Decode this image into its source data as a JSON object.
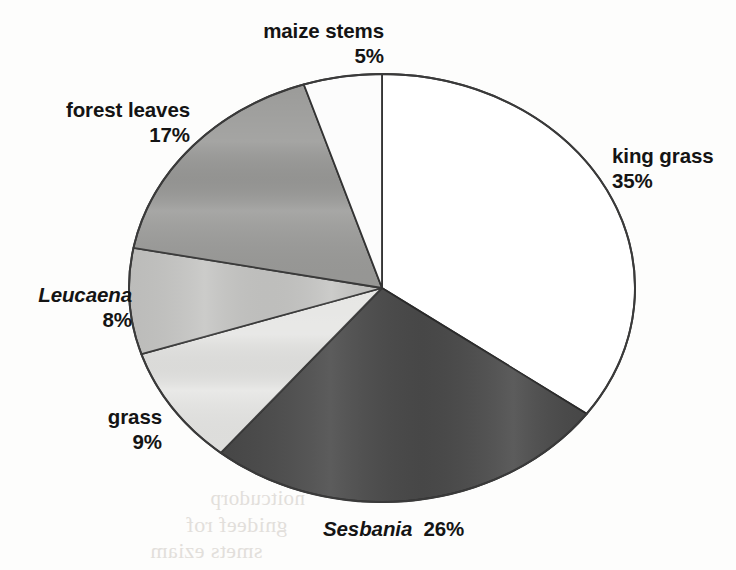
{
  "chart_data": {
    "type": "pie",
    "title": "",
    "subtitle": "",
    "xlabel": "",
    "ylabel": "",
    "legend_position": "none",
    "grid": false,
    "start_angle_deg": 0,
    "direction": "clockwise",
    "units": "percent",
    "total": 100,
    "categories": [
      "king grass",
      "Sesbania",
      "grass",
      "Leucaena",
      "forest leaves",
      "maize stems"
    ],
    "values": [
      35,
      26,
      9,
      8,
      17,
      5
    ],
    "slices": [
      {
        "name": "king grass",
        "value": 35,
        "value_label": "35%",
        "fill": "#ffffff",
        "stroke": "#333333",
        "italic_name": false,
        "label_lines": [
          "king grass",
          "35%"
        ],
        "label_align": "left"
      },
      {
        "name": "Sesbania",
        "value": 26,
        "value_label": "26%",
        "fill": "#4a4a4a",
        "stroke": "#2a2a2a",
        "italic_name": true,
        "label_lines": [
          "Sesbania",
          "26%"
        ],
        "label_align": "inline"
      },
      {
        "name": "grass",
        "value": 9,
        "value_label": "9%",
        "fill": "#e6e6e4",
        "stroke": "#3a3a3a",
        "italic_name": false,
        "label_lines": [
          "grass",
          "9%"
        ],
        "label_align": "right"
      },
      {
        "name": "Leucaena",
        "value": 8,
        "value_label": "8%",
        "fill": "#c6c6c4",
        "stroke": "#3a3a3a",
        "italic_name": true,
        "label_lines": [
          "Leucaena",
          "8%"
        ],
        "label_align": "right"
      },
      {
        "name": "forest leaves",
        "value": 17,
        "value_label": "17%",
        "fill": "#9b9b99",
        "stroke": "#3a3a3a",
        "italic_name": false,
        "label_lines": [
          "forest leaves",
          "17%"
        ],
        "label_align": "right"
      },
      {
        "name": "maize stems",
        "value": 5,
        "value_label": "5%",
        "fill": "#fcfcfc",
        "stroke": "#333333",
        "italic_name": false,
        "label_lines": [
          "maize stems",
          "5%"
        ],
        "label_align": "right"
      }
    ]
  },
  "labels": {
    "king_grass": {
      "name": "king grass",
      "percent": "35%"
    },
    "sesbania": {
      "name": "Sesbania",
      "percent": "26%"
    },
    "grass": {
      "name": "grass",
      "percent": "9%"
    },
    "leucaena": {
      "name": "Leucaena",
      "percent": "8%"
    },
    "forest_leaves": {
      "name": "forest leaves",
      "percent": "17%"
    },
    "maize_stems": {
      "name": "maize stems",
      "percent": "5%"
    }
  },
  "background_artifacts": {
    "bleed_line_1": "noitcudorp",
    "bleed_line_2": "gnideef rof",
    "bleed_line_3": "smets eziam"
  },
  "geometry": {
    "center_x": 382,
    "center_y": 288,
    "radius_x": 253,
    "radius_y": 214
  }
}
